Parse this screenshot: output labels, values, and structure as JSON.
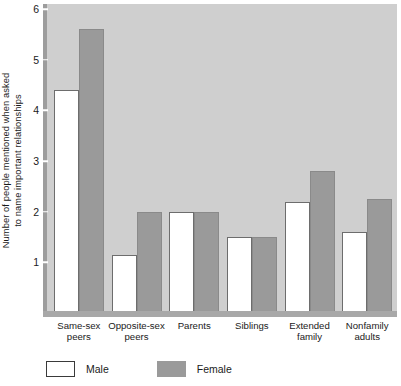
{
  "chart_data": {
    "type": "bar",
    "title": "",
    "xlabel": "",
    "ylabel_line1": "Number of people mentioned when asked",
    "ylabel_line2": "to name important relationships",
    "categories": [
      {
        "line1": "Same-sex",
        "line2": "peers"
      },
      {
        "line1": "Opposite-sex",
        "line2": "peers"
      },
      {
        "line1": "Parents",
        "line2": ""
      },
      {
        "line1": "Siblings",
        "line2": ""
      },
      {
        "line1": "Extended",
        "line2": "family"
      },
      {
        "line1": "Nonfamily",
        "line2": "adults"
      }
    ],
    "series": [
      {
        "name": "Male",
        "color": "#ffffff",
        "values": [
          4.4,
          1.15,
          2.0,
          1.5,
          2.2,
          1.6
        ]
      },
      {
        "name": "Female",
        "color": "#9a9a9a",
        "values": [
          5.6,
          2.0,
          2.0,
          1.5,
          2.8,
          2.25
        ]
      }
    ],
    "ylim": [
      0,
      6.1
    ],
    "yticks": [
      1,
      2,
      3,
      4,
      5,
      6
    ],
    "ytick_labels": [
      "1",
      "2",
      "3",
      "4",
      "5",
      "6"
    ],
    "grid": false,
    "legend_position": "bottom-left",
    "plot_background": "#cfcfcf"
  },
  "legend": {
    "items": [
      {
        "label": "Male",
        "style": "male"
      },
      {
        "label": "Female",
        "style": "female"
      }
    ]
  }
}
